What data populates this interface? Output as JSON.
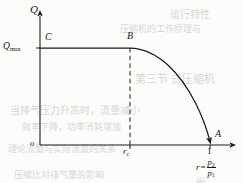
{
  "figure": {
    "kind": "line-chart",
    "background_color": "#fcfcfb",
    "ink_color": "#1a1a1a",
    "axes": {
      "y_axis_label": "Q",
      "x_axis_label_lhs": "r",
      "x_axis_label_equals": "=",
      "x_axis_label_numerator": "p",
      "x_axis_label_numerator_sub": "2",
      "x_axis_label_denominator": "p",
      "x_axis_label_denominator_sub": "1",
      "origin_label": "o"
    },
    "y_ticks": [
      {
        "label_main": "Q",
        "label_sub": "max"
      }
    ],
    "x_ticks": [
      {
        "label_main": "r",
        "label_sub": "c"
      },
      {
        "label_main": "1",
        "label_sub": ""
      }
    ],
    "points": [
      {
        "name": "C",
        "label": "C"
      },
      {
        "name": "B",
        "label": "B"
      },
      {
        "name": "A",
        "label": "A"
      }
    ],
    "bleed_through_text": [
      {
        "text": "运行特性",
        "x": 170,
        "y": 6,
        "size": 10
      },
      {
        "text": "压缩机的工作原理与",
        "x": 120,
        "y": 22,
        "size": 9
      },
      {
        "text": "第三节  式压缩机",
        "x": 135,
        "y": 70,
        "size": 11
      },
      {
        "text": "当排气压力升高时，流量减小",
        "x": 10,
        "y": 102,
        "size": 10
      },
      {
        "text": "效率下降，功率消耗增加",
        "x": 22,
        "y": 120,
        "size": 9
      },
      {
        "text": "理论流量与实际流量的关系",
        "x": 8,
        "y": 142,
        "size": 9
      },
      {
        "text": "压缩比对排气量的影响",
        "x": 14,
        "y": 168,
        "size": 9
      },
      {
        "text": "图",
        "x": 196,
        "y": 176,
        "size": 9
      }
    ]
  },
  "chart_data": {
    "type": "line",
    "title": "",
    "xlabel": "r = p2 / p1",
    "ylabel": "Q",
    "xlim": [
      0,
      1.12
    ],
    "ylim": [
      0,
      1.18
    ],
    "grid": false,
    "legend": null,
    "x_tick_values": [
      0.53,
      1.0
    ],
    "x_tick_labels": [
      "r_c",
      "1"
    ],
    "y_tick_values": [
      1.0
    ],
    "y_tick_labels": [
      "Q_max"
    ],
    "annotations": [
      {
        "label": "C",
        "x": 0.02,
        "y": 1.0,
        "note": "left end of the constant-flow plateau, on the Q axis"
      },
      {
        "label": "B",
        "x": 0.53,
        "y": 1.0,
        "note": "knee where the plateau ends, above the critical ratio r_c"
      },
      {
        "label": "A",
        "x": 1.0,
        "y": 0.0,
        "note": "flow falls to zero when the pressure ratio reaches 1"
      }
    ],
    "reference_lines": [
      {
        "orientation": "vertical",
        "value": 0.53,
        "style": "dashed",
        "from_y": 0.0,
        "to_y": 1.0,
        "label": "r_c"
      }
    ],
    "series": [
      {
        "name": "Q(r)",
        "style": "solid",
        "arrow_end": true,
        "x": [
          0.0,
          0.05,
          0.1,
          0.15,
          0.2,
          0.25,
          0.3,
          0.35,
          0.4,
          0.45,
          0.5,
          0.53,
          0.57,
          0.61,
          0.65,
          0.69,
          0.72,
          0.76,
          0.8,
          0.84,
          0.88,
          0.91,
          0.94,
          0.97,
          1.0
        ],
        "values": [
          1.0,
          1.0,
          1.0,
          1.0,
          1.0,
          1.0,
          1.0,
          1.0,
          1.0,
          1.0,
          1.0,
          1.0,
          0.985,
          0.962,
          0.93,
          0.888,
          0.848,
          0.787,
          0.715,
          0.628,
          0.522,
          0.43,
          0.327,
          0.178,
          0.0
        ]
      }
    ]
  }
}
